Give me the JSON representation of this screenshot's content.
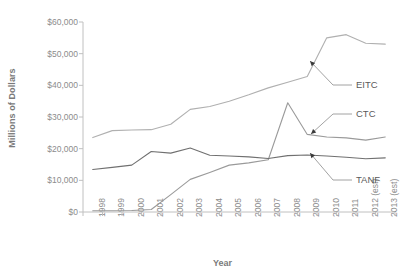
{
  "chart_data": {
    "type": "line",
    "title": "",
    "xlabel": "Year",
    "ylabel": "Millions of Dollars",
    "categories": [
      "1998",
      "1999",
      "2000",
      "2001",
      "2002",
      "2003",
      "2004",
      "2005",
      "2006",
      "2007",
      "2008",
      "2009",
      "2010",
      "2011",
      "2012 (est)",
      "2013 (est)"
    ],
    "ylim": [
      0,
      60000
    ],
    "ytick_labels": [
      "$60,000",
      "$50,000",
      "$40,000",
      "$30,000",
      "$20,000",
      "$10,000",
      "$0"
    ],
    "ytick_values": [
      60000,
      50000,
      40000,
      30000,
      20000,
      10000,
      0
    ],
    "grid": false,
    "legend_position": "inline-callout-right",
    "series": [
      {
        "name": "EITC",
        "color": "#b0b0b0",
        "values": [
          23500,
          25700,
          25900,
          26000,
          27700,
          32400,
          33300,
          35000,
          37000,
          39200,
          41000,
          42800,
          55000,
          56000,
          53300,
          53000
        ]
      },
      {
        "name": "CTC",
        "color": "#9a9a9a",
        "values": [
          400,
          400,
          450,
          800,
          5500,
          10300,
          12500,
          14800,
          15500,
          16500,
          34500,
          24500,
          23700,
          23400,
          22700,
          23700
        ]
      },
      {
        "name": "TANF",
        "color": "#707070",
        "values": [
          13400,
          14100,
          14800,
          19100,
          18600,
          20200,
          17900,
          17700,
          17400,
          16900,
          17800,
          18000,
          17700,
          17300,
          16800,
          17100
        ]
      }
    ],
    "annotations": [
      {
        "label": "EITC",
        "points_to_year": "2010",
        "points_to_value": 47000
      },
      {
        "label": "CTC",
        "points_to_year": "2010",
        "points_to_value": 24000
      },
      {
        "label": "TANF",
        "points_to_year": "2010",
        "points_to_value": 17600
      }
    ]
  },
  "axis": {
    "y_title": "Millions of Dollars",
    "x_title": "Year"
  }
}
